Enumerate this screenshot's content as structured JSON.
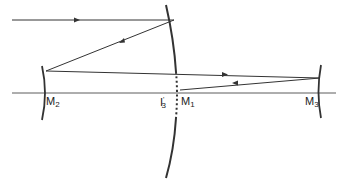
{
  "diagram": {
    "type": "optical-ray-diagram",
    "colors": {
      "stroke": "#333333",
      "background": "#ffffff"
    },
    "labels": {
      "m2": {
        "main": "M",
        "sub": "2"
      },
      "i3": {
        "main": "I",
        "sup": "'",
        "sub": "3"
      },
      "m1": {
        "main": "M",
        "sub": "1"
      },
      "m3": {
        "main": "M",
        "sub": "3"
      }
    }
  }
}
